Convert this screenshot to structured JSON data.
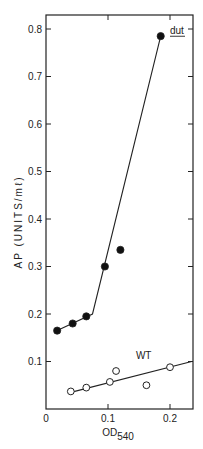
{
  "chart_data": {
    "type": "scatter",
    "title": "",
    "xlabel": "OD540",
    "xlabel_main": "OD",
    "xlabel_sub": "540",
    "ylabel": "AP (UNITS/mℓ)",
    "xlim": [
      0,
      0.235
    ],
    "ylim": [
      0,
      0.83
    ],
    "x_ticks": [
      0,
      0.1,
      0.2
    ],
    "x_tick_labels": [
      "0",
      "0.1",
      "0.2"
    ],
    "y_ticks": [
      0.1,
      0.2,
      0.3,
      0.4,
      0.5,
      0.6,
      0.7,
      0.8
    ],
    "y_tick_labels": [
      "0.1",
      "0.2",
      "0.3",
      "0.4",
      "0.5",
      "0.6",
      "0.7",
      "0.8"
    ],
    "grid": false,
    "series": [
      {
        "name": "dut",
        "marker": "filled-circle",
        "points": [
          {
            "x": 0.018,
            "y": 0.165
          },
          {
            "x": 0.043,
            "y": 0.18
          },
          {
            "x": 0.065,
            "y": 0.195
          },
          {
            "x": 0.095,
            "y": 0.3
          },
          {
            "x": 0.12,
            "y": 0.335
          },
          {
            "x": 0.185,
            "y": 0.785
          }
        ],
        "fit_line": [
          [
            0.018,
            0.165
          ],
          [
            0.075,
            0.2
          ],
          [
            0.185,
            0.785
          ]
        ]
      },
      {
        "name": "WT",
        "marker": "open-circle",
        "points": [
          {
            "x": 0.04,
            "y": 0.037
          },
          {
            "x": 0.065,
            "y": 0.045
          },
          {
            "x": 0.103,
            "y": 0.057
          },
          {
            "x": 0.113,
            "y": 0.08
          },
          {
            "x": 0.162,
            "y": 0.05
          },
          {
            "x": 0.2,
            "y": 0.088
          }
        ],
        "fit_line": [
          [
            0.04,
            0.035
          ],
          [
            0.235,
            0.1
          ]
        ]
      }
    ],
    "annotations": [
      {
        "text": "dut",
        "underlined": true,
        "x": 0.2,
        "y": 0.79
      },
      {
        "text": "WT",
        "x": 0.145,
        "y": 0.105
      }
    ]
  }
}
